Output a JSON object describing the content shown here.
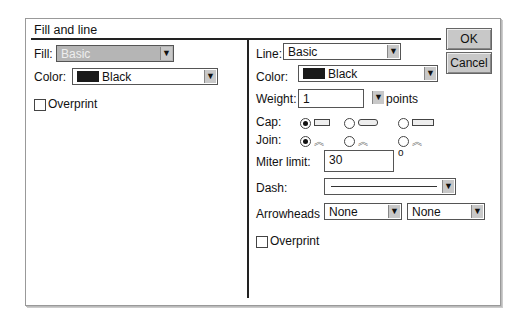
{
  "dialog": {
    "title": "Fill and line",
    "ok_label": "OK",
    "cancel_label": "Cancel"
  },
  "fill": {
    "fill_label": "Fill:",
    "fill_value": "Basic",
    "color_label": "Color:",
    "color_value": "Black",
    "overprint_label": "Overprint",
    "overprint_checked": false
  },
  "line": {
    "line_label": "Line:",
    "line_value": "Basic",
    "color_label": "Color:",
    "color_value": "Black",
    "weight_label": "Weight:",
    "weight_value": "1",
    "weight_unit": "points",
    "cap_label": "Cap:",
    "cap_selected": 0,
    "join_label": "Join:",
    "join_selected": 0,
    "miter_label": "Miter limit:",
    "miter_value": "30",
    "miter_unit": "o",
    "dash_label": "Dash:",
    "arrowheads_label": "Arrowheads",
    "arrow_start": "None",
    "arrow_end": "None",
    "overprint_label": "Overprint",
    "overprint_checked": false
  },
  "icons": {
    "dropdown_arrow": "⭳",
    "join_glyph": "≋"
  }
}
